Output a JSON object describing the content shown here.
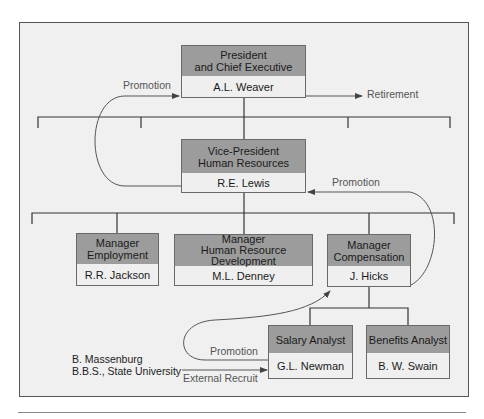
{
  "colors": {
    "frame_bg": "#f0f0f0",
    "header_fill": "#9c9c9c",
    "name_fill": "#efefef",
    "line": "#333333"
  },
  "nodes": {
    "president": {
      "title_lines": [
        "President",
        "and Chief Executive"
      ],
      "name": "A.L. Weaver"
    },
    "vp_hr": {
      "title_lines": [
        "Vice-President",
        "Human Resources"
      ],
      "name": "R.E. Lewis"
    },
    "mgr_employment": {
      "title_lines": [
        "Manager",
        "Employment"
      ],
      "name": "R.R. Jackson"
    },
    "mgr_hrd": {
      "title_lines": [
        "Manager",
        "Human Resource",
        "Development"
      ],
      "name": "M.L. Denney"
    },
    "mgr_compensation": {
      "title_lines": [
        "Manager",
        "Compensation"
      ],
      "name": "J. Hicks"
    },
    "salary_analyst": {
      "title_lines": [
        "Salary Analyst"
      ],
      "name": "G.L. Newman"
    },
    "benefits_analyst": {
      "title_lines": [
        "Benefits Analyst"
      ],
      "name": "B. W. Swain"
    }
  },
  "flows": {
    "promotion_top": "Promotion",
    "retirement": "Retirement",
    "promotion_right": "Promotion",
    "promotion_bottom": "Promotion",
    "external_recruit": "External Recruit"
  },
  "recruit": {
    "name": "B. Massenburg",
    "credential": "B.B.S., State University"
  }
}
